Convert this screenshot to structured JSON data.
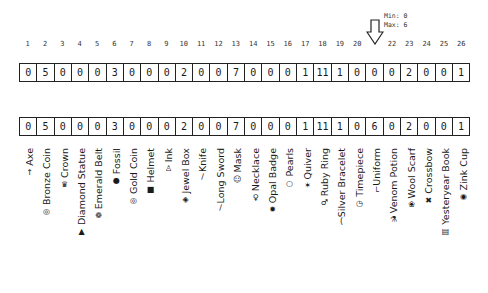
{
  "indicator": {
    "min_label": "Min: 0",
    "max_label": "Max: 6",
    "pointer_column": 21
  },
  "column_indices": [
    "1",
    "2",
    "3",
    "4",
    "5",
    "6",
    "7",
    "8",
    "9",
    "10",
    "11",
    "12",
    "13",
    "14",
    "15",
    "16",
    "17",
    "18",
    "19",
    "20",
    "",
    "22",
    "23",
    "24",
    "25",
    "26"
  ],
  "top_row": [
    "0",
    "5",
    "0",
    "0",
    "0",
    "3",
    "0",
    "0",
    "0",
    "2",
    "0",
    "0",
    "7",
    "0",
    "0",
    "0",
    "1",
    "11",
    "1",
    "0",
    "0",
    "0",
    "2",
    "0",
    "0",
    "1"
  ],
  "bottom_row": [
    "0",
    "5",
    "0",
    "0",
    "0",
    "3",
    "0",
    "0",
    "0",
    "2",
    "0",
    "0",
    "7",
    "0",
    "0",
    "0",
    "1",
    "11",
    "1",
    "0",
    "6",
    "0",
    "2",
    "0",
    "0",
    "1"
  ],
  "items": [
    {
      "name": "Axe",
      "icon": "axe-icon",
      "glyph": "↑"
    },
    {
      "name": "Bronze Coin",
      "icon": "coin-icon",
      "glyph": "◎"
    },
    {
      "name": "Crown",
      "icon": "crown-icon",
      "glyph": "♛"
    },
    {
      "name": "Diamond Statue",
      "icon": "statue-icon",
      "glyph": "▲"
    },
    {
      "name": "Emerald Belt",
      "icon": "belt-icon",
      "glyph": "❁"
    },
    {
      "name": "Fossil",
      "icon": "fossil-icon",
      "glyph": "●"
    },
    {
      "name": "Gold Coin",
      "icon": "coin-icon",
      "glyph": "◎"
    },
    {
      "name": "Helmet",
      "icon": "helmet-icon",
      "glyph": "■"
    },
    {
      "name": "Ink",
      "icon": "ink-icon",
      "glyph": "♙"
    },
    {
      "name": "Jewel Box",
      "icon": "jewel-box-icon",
      "glyph": "◈"
    },
    {
      "name": "Knife",
      "icon": "knife-icon",
      "glyph": "∕"
    },
    {
      "name": "Long Sword",
      "icon": "sword-icon",
      "glyph": "∕"
    },
    {
      "name": "Mask",
      "icon": "mask-icon",
      "glyph": "☺"
    },
    {
      "name": "Necklace",
      "icon": "necklace-icon",
      "glyph": "♀"
    },
    {
      "name": "Opal Badge",
      "icon": "badge-icon",
      "glyph": "✹"
    },
    {
      "name": "Pearls",
      "icon": "pearls-icon",
      "glyph": "○"
    },
    {
      "name": "Quiver",
      "icon": "quiver-icon",
      "glyph": "✶"
    },
    {
      "name": "Ruby Ring",
      "icon": "ring-icon",
      "glyph": "♂"
    },
    {
      "name": "Silver Bracelet",
      "icon": "bracelet-icon",
      "glyph": "("
    },
    {
      "name": "Timepiece",
      "icon": "timepiece-icon",
      "glyph": "◷"
    },
    {
      "name": "Uniform",
      "icon": "uniform-icon",
      "glyph": "└"
    },
    {
      "name": "Venom Potion",
      "icon": "potion-icon",
      "glyph": "⚗"
    },
    {
      "name": "Wool Scarf",
      "icon": "scarf-icon",
      "glyph": "❀"
    },
    {
      "name": "Crossbow",
      "icon": "crossbow-icon",
      "glyph": "✖"
    },
    {
      "name": "Yesteryear Book",
      "icon": "book-icon",
      "glyph": "▤"
    },
    {
      "name": "Zink Cup",
      "icon": "cup-icon",
      "glyph": "◉"
    }
  ]
}
